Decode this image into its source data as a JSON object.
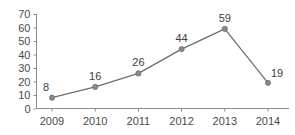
{
  "chart_data": {
    "type": "line",
    "title": "",
    "xlabel": "",
    "ylabel": "",
    "categories": [
      "2009",
      "2010",
      "2011",
      "2012",
      "2013",
      "2014"
    ],
    "values": [
      8,
      16,
      26,
      44,
      59,
      19
    ],
    "point_labels": [
      "8",
      "16",
      "26",
      "44",
      "59",
      "19"
    ],
    "ylim": [
      0,
      70
    ],
    "ytick_values": [
      0,
      10,
      20,
      30,
      40,
      50,
      60,
      70
    ],
    "ytick_labels": [
      "0",
      "10",
      "20",
      "30",
      "40",
      "50",
      "60",
      "70"
    ],
    "grid": false,
    "legend": false,
    "legend_position": "none",
    "series": [
      {
        "name": "",
        "values": [
          8,
          16,
          26,
          44,
          59,
          19
        ]
      }
    ],
    "colors": {
      "line": "#6e6e6e",
      "marker": "#8a8a8a",
      "marker_edge": "#6e6e6e",
      "axis": "#8c8c8c",
      "tick_text": "#4a4a4a",
      "label_text": "#3c3c3c",
      "background": "#ffffff"
    }
  }
}
